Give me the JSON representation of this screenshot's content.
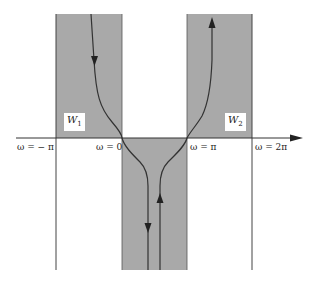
{
  "figure": {
    "regions": [
      {
        "id": "W1",
        "name": "W",
        "subscript": "1",
        "fill": "#a9a9a9"
      },
      {
        "id": "W2",
        "name": "W",
        "subscript": "2",
        "fill": "#a9a9a9"
      },
      {
        "id": "center",
        "fill": "#a9a9a9"
      }
    ],
    "axis_labels": {
      "neg_pi": "ω = − π",
      "zero": "ω = 0",
      "pi": "ω = π",
      "two_pi": "ω = 2π"
    },
    "colors": {
      "shade": "#a9a9a9",
      "line": "#333333",
      "background": "#ffffff"
    }
  }
}
